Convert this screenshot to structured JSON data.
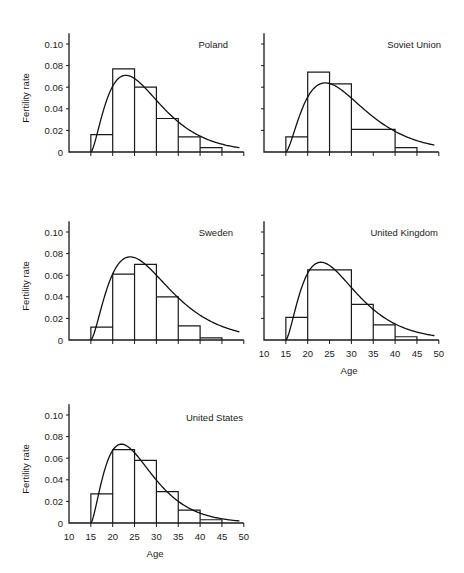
{
  "figure": {
    "ylabel": "Fertility rate",
    "xlabel": "Age",
    "y_tick_labels": [
      "0",
      "0.02",
      "0.04",
      "0.06",
      "0.08",
      "0.10"
    ],
    "x_tick_labels": [
      "10",
      "15",
      "20",
      "25",
      "30",
      "35",
      "40",
      "45",
      "50"
    ]
  },
  "chart_data": [
    {
      "type": "bar",
      "title": "Poland",
      "xlabel": "",
      "ylabel": "Fertility rate",
      "bins": [
        [
          15,
          20
        ],
        [
          20,
          25
        ],
        [
          25,
          30
        ],
        [
          30,
          35
        ],
        [
          35,
          40
        ],
        [
          40,
          45
        ]
      ],
      "values": [
        0.016,
        0.077,
        0.06,
        0.031,
        0.014,
        0.004
      ],
      "fitted_curve_peak": {
        "age": 23,
        "rate": 0.071
      },
      "xlim": [
        10,
        50
      ],
      "ylim": [
        0,
        0.11
      ],
      "show_x_tick_labels": false,
      "show_y_tick_labels": true
    },
    {
      "type": "bar",
      "title": "Soviet Union",
      "xlabel": "",
      "ylabel": "",
      "bins": [
        [
          15,
          20
        ],
        [
          20,
          25
        ],
        [
          25,
          30
        ],
        [
          30,
          40
        ],
        [
          40,
          45
        ]
      ],
      "values": [
        0.014,
        0.074,
        0.063,
        0.021,
        0.004
      ],
      "fitted_curve_peak": {
        "age": 24,
        "rate": 0.064
      },
      "xlim": [
        10,
        50
      ],
      "ylim": [
        0,
        0.11
      ],
      "show_x_tick_labels": false,
      "show_y_tick_labels": false
    },
    {
      "type": "bar",
      "title": "Sweden",
      "xlabel": "",
      "ylabel": "Fertility rate",
      "bins": [
        [
          15,
          20
        ],
        [
          20,
          25
        ],
        [
          25,
          30
        ],
        [
          30,
          35
        ],
        [
          35,
          40
        ],
        [
          40,
          45
        ]
      ],
      "values": [
        0.012,
        0.061,
        0.07,
        0.04,
        0.013,
        0.002
      ],
      "fitted_curve_peak": {
        "age": 24,
        "rate": 0.077
      },
      "xlim": [
        10,
        50
      ],
      "ylim": [
        0,
        0.11
      ],
      "show_x_tick_labels": false,
      "show_y_tick_labels": true
    },
    {
      "type": "bar",
      "title": "United Kingdom",
      "xlabel": "Age",
      "ylabel": "",
      "bins": [
        [
          15,
          20
        ],
        [
          20,
          30
        ],
        [
          30,
          35
        ],
        [
          35,
          40
        ],
        [
          40,
          45
        ]
      ],
      "values": [
        0.021,
        0.065,
        0.033,
        0.014,
        0.003
      ],
      "fitted_curve_peak": {
        "age": 23,
        "rate": 0.072
      },
      "xlim": [
        10,
        50
      ],
      "ylim": [
        0,
        0.11
      ],
      "show_x_tick_labels": true,
      "show_y_tick_labels": false
    },
    {
      "type": "bar",
      "title": "United States",
      "xlabel": "Age",
      "ylabel": "Fertility rate",
      "bins": [
        [
          15,
          20
        ],
        [
          20,
          25
        ],
        [
          25,
          30
        ],
        [
          30,
          35
        ],
        [
          35,
          40
        ],
        [
          40,
          45
        ]
      ],
      "values": [
        0.027,
        0.068,
        0.058,
        0.029,
        0.012,
        0.003
      ],
      "fitted_curve_peak": {
        "age": 22,
        "rate": 0.073
      },
      "xlim": [
        10,
        50
      ],
      "ylim": [
        0,
        0.11
      ],
      "show_x_tick_labels": true,
      "show_y_tick_labels": true
    }
  ]
}
